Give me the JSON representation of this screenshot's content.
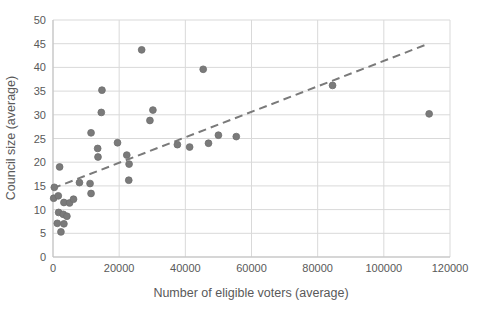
{
  "chart_data": {
    "type": "scatter",
    "title": "",
    "xlabel": "Number of eligible voters (average)",
    "ylabel": "Council size (average)",
    "xlim": [
      0,
      120000
    ],
    "ylim": [
      0,
      50
    ],
    "x_ticks": [
      0,
      20000,
      40000,
      60000,
      80000,
      100000,
      120000
    ],
    "y_ticks": [
      0,
      5,
      10,
      15,
      20,
      25,
      30,
      35,
      40,
      45,
      50
    ],
    "grid": true,
    "legend": false,
    "series": [
      {
        "name": "councils",
        "marker": "circle",
        "color": "#7a7a7a",
        "points": [
          [
            200,
            12.4
          ],
          [
            400,
            14.7
          ],
          [
            1300,
            7.1
          ],
          [
            1600,
            12.9
          ],
          [
            1700,
            9.4
          ],
          [
            2000,
            19.0
          ],
          [
            2400,
            5.3
          ],
          [
            3100,
            9.0
          ],
          [
            3300,
            11.5
          ],
          [
            3300,
            7.0
          ],
          [
            4200,
            8.6
          ],
          [
            5000,
            11.4
          ],
          [
            6200,
            12.2
          ],
          [
            8000,
            15.7
          ],
          [
            11200,
            15.5
          ],
          [
            11500,
            13.4
          ],
          [
            11500,
            26.2
          ],
          [
            13500,
            22.9
          ],
          [
            13600,
            21.1
          ],
          [
            14600,
            30.5
          ],
          [
            14800,
            35.2
          ],
          [
            19500,
            24.1
          ],
          [
            22300,
            21.5
          ],
          [
            22900,
            16.2
          ],
          [
            23000,
            19.6
          ],
          [
            26800,
            43.7
          ],
          [
            29300,
            28.8
          ],
          [
            30200,
            31.0
          ],
          [
            37600,
            23.7
          ],
          [
            41300,
            23.2
          ],
          [
            45400,
            39.6
          ],
          [
            47000,
            24.0
          ],
          [
            50000,
            25.7
          ],
          [
            55400,
            25.4
          ],
          [
            84500,
            36.2
          ],
          [
            113700,
            30.2
          ]
        ]
      }
    ],
    "trendline": {
      "style": "dashed",
      "color": "#7a7a7a",
      "x1": 0,
      "y1": 14.5,
      "x2": 113500,
      "y2": 45.0
    }
  },
  "style_colors": {
    "gridline": "#d9d9d9",
    "axis_line": "#c0c0c0",
    "tick_label": "#595959",
    "point_fill": "#7a7a7a",
    "point_stroke": "#6e6e6e"
  }
}
